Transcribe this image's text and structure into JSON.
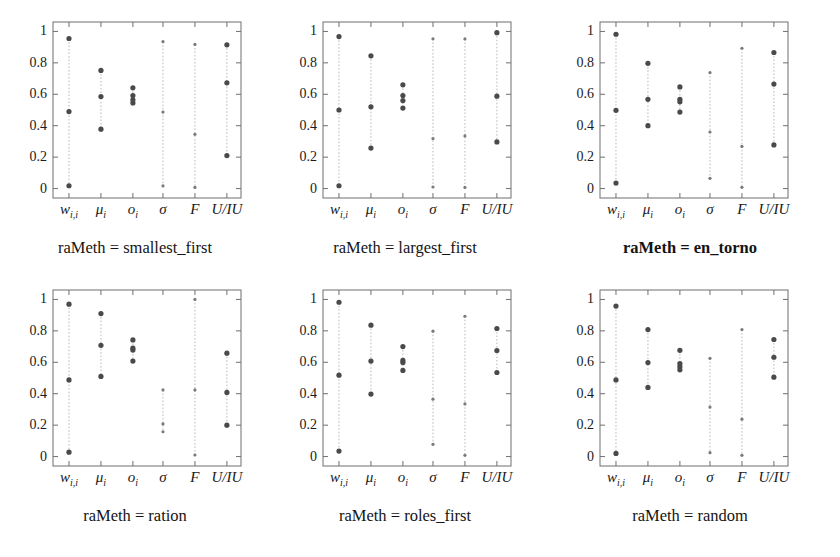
{
  "figure": {
    "panel_count": 6,
    "y_ticks": [
      "0",
      "0.2",
      "0.4",
      "0.6",
      "0.8",
      "1"
    ],
    "y_tick_values": [
      0,
      0.2,
      0.4,
      0.6,
      0.8,
      1
    ],
    "x_categories": [
      "w_{i,i}",
      "μ_i",
      "o_i",
      "σ",
      "F",
      "U/IU"
    ],
    "x_tick_labels": [
      "w",
      "μ",
      "o",
      "σ",
      "F",
      "U/IU"
    ],
    "x_label_display": [
      "w",
      "μ",
      "o",
      "σ",
      "F",
      "U/IU"
    ],
    "x_sub": [
      "i,i",
      "i",
      "i",
      "",
      "",
      ""
    ]
  },
  "chart_data": [
    {
      "type": "scatter",
      "title": "raMeth = smallest_first",
      "title_bold": false,
      "xlabel": "",
      "ylabel": "",
      "ylim": [
        -0.06,
        1.06
      ],
      "grid": false,
      "categories": [
        "w_{i,i}",
        "mu_i",
        "o_i",
        "sigma",
        "F",
        "U/IU"
      ],
      "series": [
        {
          "name": "max",
          "values": [
            0.955,
            0.752,
            0.641,
            0.935,
            0.917,
            0.915
          ]
        },
        {
          "name": "median",
          "values": [
            0.49,
            0.586,
            0.592,
            0.487,
            0.345,
            0.673
          ]
        },
        {
          "name": "min",
          "values": [
            0.018,
            0.378,
            0.545,
            0.017,
            0.007,
            0.21
          ]
        },
        {
          "name": "extra",
          "values": [
            null,
            null,
            0.565,
            null,
            null,
            null
          ]
        }
      ]
    },
    {
      "type": "scatter",
      "title": "raMeth = largest_first",
      "title_bold": false,
      "xlabel": "",
      "ylabel": "",
      "ylim": [
        -0.06,
        1.06
      ],
      "grid": false,
      "categories": [
        "w_{i,i}",
        "mu_i",
        "o_i",
        "sigma",
        "F",
        "U/IU"
      ],
      "series": [
        {
          "name": "max",
          "values": [
            0.967,
            0.845,
            0.66,
            0.953,
            0.952,
            0.992
          ]
        },
        {
          "name": "median",
          "values": [
            0.5,
            0.52,
            0.592,
            0.318,
            0.335,
            0.588
          ]
        },
        {
          "name": "min",
          "values": [
            0.018,
            0.258,
            0.512,
            0.01,
            0.007,
            0.297
          ]
        },
        {
          "name": "extra",
          "values": [
            null,
            null,
            0.56,
            null,
            null,
            null
          ]
        }
      ]
    },
    {
      "type": "scatter",
      "title": "raMeth = en_torno",
      "title_bold": true,
      "xlabel": "",
      "ylabel": "",
      "ylim": [
        -0.06,
        1.06
      ],
      "grid": false,
      "categories": [
        "w_{i,i}",
        "mu_i",
        "o_i",
        "sigma",
        "F",
        "U/IU"
      ],
      "series": [
        {
          "name": "max",
          "values": [
            0.982,
            0.797,
            0.647,
            0.738,
            0.893,
            0.866
          ]
        },
        {
          "name": "median",
          "values": [
            0.498,
            0.568,
            0.568,
            0.36,
            0.268,
            0.665
          ]
        },
        {
          "name": "min",
          "values": [
            0.035,
            0.4,
            0.487,
            0.065,
            0.008,
            0.278
          ]
        },
        {
          "name": "extra",
          "values": [
            null,
            null,
            0.552,
            null,
            null,
            null
          ]
        }
      ]
    },
    {
      "type": "scatter",
      "title": "raMeth = ration",
      "title_bold": false,
      "xlabel": "",
      "ylabel": "",
      "ylim": [
        -0.06,
        1.06
      ],
      "grid": false,
      "categories": [
        "w_{i,i}",
        "mu_i",
        "o_i",
        "sigma",
        "F",
        "U/IU"
      ],
      "series": [
        {
          "name": "max",
          "values": [
            0.97,
            0.91,
            0.742,
            0.424,
            1.0,
            0.658
          ]
        },
        {
          "name": "median",
          "values": [
            0.488,
            0.708,
            0.69,
            0.208,
            0.424,
            0.408
          ]
        },
        {
          "name": "min",
          "values": [
            0.028,
            0.51,
            0.608,
            0.158,
            0.01,
            0.2
          ]
        },
        {
          "name": "extra",
          "values": [
            null,
            null,
            0.678,
            null,
            null,
            null
          ]
        }
      ]
    },
    {
      "type": "scatter",
      "title": "raMeth = roles_first",
      "title_bold": false,
      "xlabel": "",
      "ylabel": "",
      "ylim": [
        -0.06,
        1.06
      ],
      "grid": false,
      "categories": [
        "w_{i,i}",
        "mu_i",
        "o_i",
        "sigma",
        "F",
        "U/IU"
      ],
      "series": [
        {
          "name": "max",
          "values": [
            0.982,
            0.836,
            0.7,
            0.798,
            0.893,
            0.815
          ]
        },
        {
          "name": "median",
          "values": [
            0.518,
            0.608,
            0.612,
            0.365,
            0.335,
            0.675
          ]
        },
        {
          "name": "min",
          "values": [
            0.035,
            0.398,
            0.548,
            0.078,
            0.008,
            0.535
          ]
        },
        {
          "name": "extra",
          "values": [
            null,
            null,
            0.598,
            null,
            null,
            null
          ]
        }
      ]
    },
    {
      "type": "scatter",
      "title": "raMeth = random",
      "title_bold": false,
      "xlabel": "",
      "ylabel": "",
      "ylim": [
        -0.06,
        1.06
      ],
      "grid": false,
      "categories": [
        "w_{i,i}",
        "mu_i",
        "o_i",
        "sigma",
        "F",
        "U/IU"
      ],
      "series": [
        {
          "name": "max",
          "values": [
            0.958,
            0.808,
            0.676,
            0.625,
            0.808,
            0.745
          ]
        },
        {
          "name": "median",
          "values": [
            0.488,
            0.598,
            0.592,
            0.315,
            0.238,
            0.632
          ]
        },
        {
          "name": "min",
          "values": [
            0.02,
            0.44,
            0.552,
            0.025,
            0.008,
            0.505
          ]
        },
        {
          "name": "extra",
          "values": [
            null,
            null,
            0.572,
            null,
            null,
            null
          ]
        }
      ]
    }
  ]
}
